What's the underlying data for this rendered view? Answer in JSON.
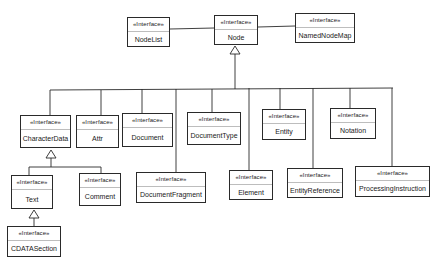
{
  "diagram": {
    "type": "UML class diagram",
    "stereotype": "«Interface»",
    "colors": {
      "line": "#2a2a2a",
      "background": "#ffffff",
      "divider": "#bdbdbd"
    },
    "nodes": [
      {
        "id": "nodelist",
        "stereotype": "«Interface»",
        "name": "NodeList",
        "x": 127,
        "y": 17,
        "w": 43,
        "h": 30
      },
      {
        "id": "node",
        "stereotype": "«Interface»",
        "name": "Node",
        "x": 214,
        "y": 15,
        "w": 44,
        "h": 30
      },
      {
        "id": "namednodemap",
        "stereotype": "«Interface»",
        "name": "NamedNodeMap",
        "x": 295,
        "y": 13,
        "w": 60,
        "h": 30
      },
      {
        "id": "characterdata",
        "stereotype": "«Interface»",
        "name": "CharacterData",
        "x": 20,
        "y": 115,
        "w": 51,
        "h": 33
      },
      {
        "id": "attr",
        "stereotype": "«Interface»",
        "name": "Attr",
        "x": 76,
        "y": 115,
        "w": 43,
        "h": 33
      },
      {
        "id": "document",
        "stereotype": "«Interface»",
        "name": "Document",
        "x": 122,
        "y": 113,
        "w": 51,
        "h": 34
      },
      {
        "id": "documenttype",
        "stereotype": "«Interface»",
        "name": "DocumentType",
        "x": 187,
        "y": 112,
        "w": 54,
        "h": 33
      },
      {
        "id": "entity",
        "stereotype": "«Interface»",
        "name": "Entity",
        "x": 262,
        "y": 109,
        "w": 44,
        "h": 31
      },
      {
        "id": "notation",
        "stereotype": "«Interface»",
        "name": "Notation",
        "x": 330,
        "y": 108,
        "w": 46,
        "h": 31
      },
      {
        "id": "text",
        "stereotype": "«Interface»",
        "name": "Text",
        "x": 11,
        "y": 175,
        "w": 42,
        "h": 34
      },
      {
        "id": "comment",
        "stereotype": "«Interface»",
        "name": "Comment",
        "x": 79,
        "y": 173,
        "w": 42,
        "h": 33
      },
      {
        "id": "documentfragment",
        "stereotype": "«Interface»",
        "name": "DocumentFragment",
        "x": 136,
        "y": 172,
        "w": 70,
        "h": 31
      },
      {
        "id": "element",
        "stereotype": "«Interface»",
        "name": "Element",
        "x": 229,
        "y": 170,
        "w": 44,
        "h": 30
      },
      {
        "id": "entityreference",
        "stereotype": "«Interface»",
        "name": "EntityReference",
        "x": 287,
        "y": 168,
        "w": 56,
        "h": 30
      },
      {
        "id": "processinginstruction",
        "stereotype": "«Interface»",
        "name": "ProcessingInstruction",
        "x": 355,
        "y": 166,
        "w": 75,
        "h": 31
      },
      {
        "id": "cdatasection",
        "stereotype": "«Interface»",
        "name": "CDATASection",
        "x": 7,
        "y": 226,
        "w": 54,
        "h": 31
      }
    ],
    "associations": [
      {
        "from": "nodelist",
        "to": "node"
      },
      {
        "from": "node",
        "to": "namednodemap"
      }
    ],
    "generalizations": [
      {
        "parent": "node",
        "children": [
          "characterdata",
          "attr",
          "document",
          "documenttype",
          "documentfragment",
          "entity",
          "element",
          "entityreference",
          "notation",
          "processinginstruction"
        ]
      },
      {
        "parent": "characterdata",
        "children": [
          "text",
          "comment"
        ]
      },
      {
        "parent": "text",
        "children": [
          "cdatasection"
        ]
      }
    ]
  }
}
